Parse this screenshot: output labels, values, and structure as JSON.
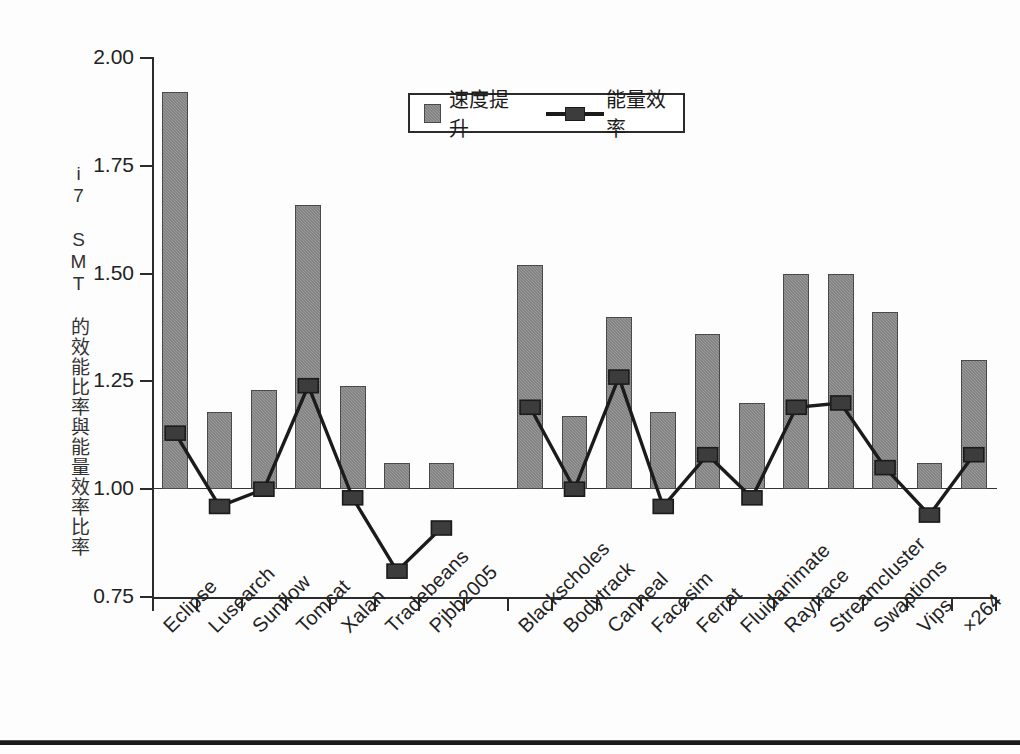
{
  "figure": {
    "ylabel": "i7 SMT 的效能比率與能量效率比率"
  },
  "legend": {
    "items": [
      {
        "label": "速度提升",
        "icon": "gray-square-swatch",
        "color": "#9a9a9a"
      },
      {
        "label": "能量效率",
        "icon": "black-line-square-marker",
        "color": "#1b1b1b"
      }
    ]
  },
  "yaxis": {
    "ticks": [
      "2.00",
      "1.75",
      "1.50",
      "1.25",
      "1.00",
      "0.75"
    ],
    "min": 0.75,
    "max": 2.0
  },
  "chart_data": {
    "type": "bar",
    "title": "",
    "subtitle": "",
    "xlabel": "",
    "ylabel": "i7 SMT 的效能比率與能量效率比率",
    "ylim": [
      0.75,
      2.0
    ],
    "yticks": [
      0.75,
      1.0,
      1.25,
      1.5,
      1.75,
      2.0
    ],
    "grid": false,
    "legend_position": "top-center",
    "reference_line": 1.0,
    "categories": [
      "Eclipse",
      "Lusearch",
      "Sunflow",
      "Tomcat",
      "Xalan",
      "Tradebeans",
      "Pjbb2005",
      "",
      "Blackscholes",
      "Bodytrack",
      "Canneal",
      "Facesim",
      "Ferret",
      "Fluidanimate",
      "Raytrace",
      "Streamcluster",
      "Swaptions",
      "Vips",
      "×264"
    ],
    "series": [
      {
        "name": "速度提升",
        "type": "bar",
        "color": "#9a9a9a",
        "values": [
          1.92,
          1.18,
          1.23,
          1.66,
          1.24,
          1.06,
          1.06,
          null,
          1.52,
          1.17,
          1.4,
          1.18,
          1.36,
          1.2,
          1.5,
          1.5,
          1.41,
          1.06,
          1.3
        ]
      },
      {
        "name": "能量效率",
        "type": "line",
        "color": "#1b1b1b",
        "values": [
          1.13,
          0.96,
          1.0,
          1.24,
          0.98,
          0.81,
          0.91,
          null,
          1.19,
          1.0,
          1.26,
          0.96,
          1.08,
          0.98,
          1.19,
          1.2,
          1.05,
          0.94,
          1.08
        ]
      }
    ]
  }
}
